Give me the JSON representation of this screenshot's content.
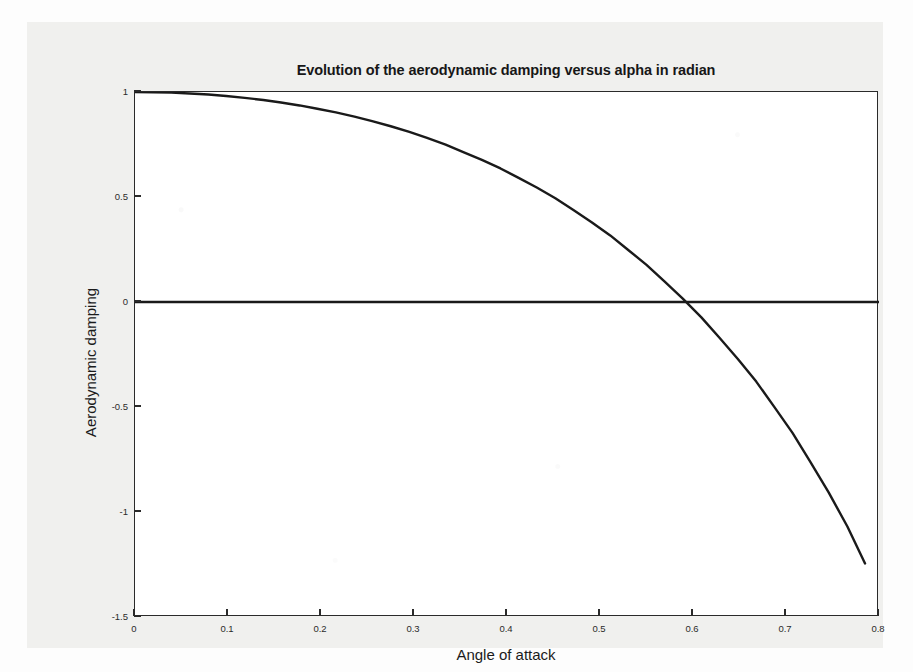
{
  "chart_data": {
    "type": "line",
    "title": "Evolution of the aerodynamic damping versus alpha in radian",
    "xlabel": "Angle of attack",
    "ylabel": "Aerodynamic damping",
    "xlim": [
      0,
      0.8
    ],
    "ylim": [
      -1.5,
      1.0
    ],
    "xticks": [
      "0",
      "0.1",
      "0.2",
      "0.3",
      "0.4",
      "0.5",
      "0.6",
      "0.7",
      "0.8"
    ],
    "xtick_values": [
      0,
      0.1,
      0.2,
      0.3,
      0.4,
      0.5,
      0.6,
      0.7,
      0.8
    ],
    "yticks": [
      "1",
      "0.5",
      "0",
      "-0.5",
      "-1",
      "-1.5"
    ],
    "ytick_values": [
      1,
      0.5,
      0,
      -0.5,
      -1,
      -1.5
    ],
    "grid": false,
    "legend": null,
    "line_color": "#1a1a1a",
    "zero_line": {
      "y": 0,
      "color": "#1a1a1a",
      "description": "horizontal reference line at zero damping"
    },
    "annotations": [
      {
        "text": "zero crossing",
        "x": 0.527,
        "y": 0
      }
    ],
    "series": [
      {
        "name": "Aerodynamic damping",
        "x": [
          0.0,
          0.02,
          0.039,
          0.059,
          0.079,
          0.098,
          0.118,
          0.138,
          0.157,
          0.177,
          0.196,
          0.216,
          0.236,
          0.255,
          0.275,
          0.295,
          0.314,
          0.334,
          0.353,
          0.373,
          0.393,
          0.412,
          0.432,
          0.452,
          0.471,
          0.491,
          0.511,
          0.53,
          0.55,
          0.569,
          0.589,
          0.609,
          0.628,
          0.648,
          0.668,
          0.687,
          0.707,
          0.726,
          0.746,
          0.766,
          0.785
        ],
        "y": [
          1.0,
          0.999,
          0.997,
          0.993,
          0.988,
          0.981,
          0.972,
          0.962,
          0.95,
          0.936,
          0.92,
          0.903,
          0.883,
          0.861,
          0.837,
          0.81,
          0.781,
          0.749,
          0.714,
          0.677,
          0.636,
          0.592,
          0.545,
          0.494,
          0.439,
          0.38,
          0.317,
          0.249,
          0.177,
          0.099,
          0.016,
          -0.073,
          -0.168,
          -0.27,
          -0.379,
          -0.497,
          -0.623,
          -0.76,
          -0.908,
          -1.069,
          -1.245
        ]
      }
    ]
  },
  "figure": {
    "background_color": "#f0f0ee",
    "plot_background_color": "#ffffff",
    "frame_color": "#2a2a2a"
  }
}
